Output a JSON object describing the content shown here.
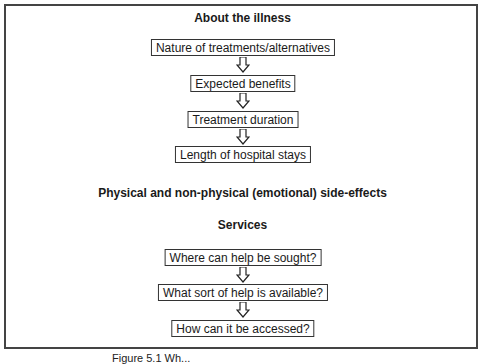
{
  "diagram": {
    "sections": [
      {
        "title": "About the illness",
        "steps": [
          "Nature of treatments/alternatives",
          "Expected benefits",
          "Treatment duration",
          "Length of hospital stays"
        ]
      },
      {
        "title": "Physical and non-physical (emotional) side-effects",
        "steps": []
      },
      {
        "title": "Services",
        "steps": [
          "Where can help be sought?",
          "What sort of help is available?",
          "How can it be accessed?"
        ]
      }
    ],
    "caption": "Figure 5.1 Wh..."
  }
}
